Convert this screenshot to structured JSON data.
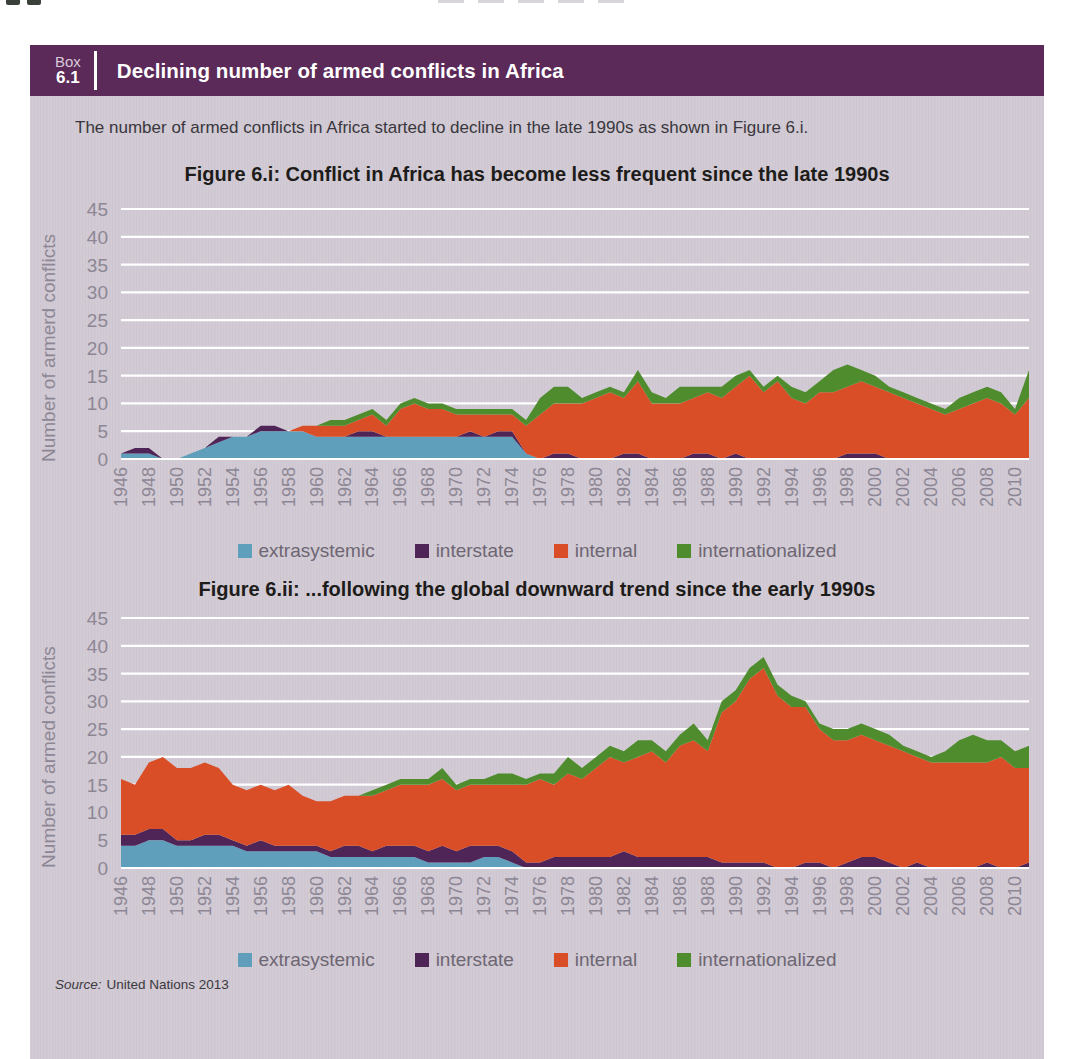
{
  "header": {
    "box_word": "Box",
    "box_number": "6.1",
    "title": "Declining number of armed conflicts in Africa"
  },
  "intro_text": "The number of armed conflicts in Africa started to decline in the late 1990s as shown in Figure 6.i.",
  "source": {
    "label": "Source:",
    "text": "United Nations 2013"
  },
  "colors": {
    "header_bar": "#5b2a58",
    "body_background": "#d1c9d3",
    "gridline": "#ffffff",
    "tick_text": "#8d8795",
    "extrasystemic": "#5f9fbb",
    "interstate": "#4f2558",
    "internal": "#d94e26",
    "internationalized": "#4e8c2e"
  },
  "legend": {
    "items": [
      {
        "label": "extrasystemic",
        "color": "#5f9fbb"
      },
      {
        "label": "interstate",
        "color": "#4f2558"
      },
      {
        "label": "internal",
        "color": "#d94e26"
      },
      {
        "label": "internationalized",
        "color": "#4e8c2e"
      }
    ]
  },
  "chart_data": [
    {
      "type": "area",
      "stacked": true,
      "title": "Figure 6.i: Conflict in Africa has become less frequent since the late 1990s",
      "ylabel": "Number of armerd conflicts",
      "xlabel": "",
      "ylim": [
        0,
        45
      ],
      "yticks": [
        0,
        5,
        10,
        15,
        20,
        25,
        30,
        35,
        40,
        45
      ],
      "grid": "horizontal-white",
      "legend_position": "below-center",
      "x_start": 1946,
      "x_end": 2011,
      "xtick_labels": [
        "1946",
        "1948",
        "1950",
        "1952",
        "1954",
        "1956",
        "1958",
        "1960",
        "1962",
        "1964",
        "1966",
        "1968",
        "1970",
        "1972",
        "1974",
        "1976",
        "1978",
        "1980",
        "1982",
        "1984",
        "1986",
        "1988",
        "1990",
        "1992",
        "1994",
        "1996",
        "1998",
        "2000",
        "2002",
        "2004",
        "2006",
        "2008",
        "2010"
      ],
      "series": [
        {
          "name": "extrasystemic",
          "color": "#5f9fbb",
          "values": [
            1,
            1,
            1,
            0,
            0,
            1,
            2,
            3,
            4,
            4,
            5,
            5,
            5,
            5,
            4,
            4,
            4,
            4,
            4,
            4,
            4,
            4,
            4,
            4,
            4,
            4,
            4,
            4,
            4,
            1,
            0,
            0,
            0,
            0,
            0,
            0,
            0,
            0,
            0,
            0,
            0,
            0,
            0,
            0,
            0,
            0,
            0,
            0,
            0,
            0,
            0,
            0,
            0,
            0,
            0,
            0,
            0,
            0,
            0,
            0,
            0,
            0,
            0,
            0,
            0,
            0
          ]
        },
        {
          "name": "interstate",
          "color": "#4f2558",
          "values": [
            0,
            1,
            1,
            0,
            0,
            0,
            0,
            1,
            0,
            0,
            1,
            1,
            0,
            0,
            0,
            0,
            0,
            1,
            1,
            0,
            0,
            0,
            0,
            0,
            0,
            1,
            0,
            1,
            1,
            0,
            0,
            1,
            1,
            0,
            0,
            0,
            1,
            1,
            0,
            0,
            0,
            1,
            1,
            0,
            1,
            0,
            0,
            0,
            0,
            0,
            0,
            0,
            1,
            1,
            1,
            0,
            0,
            0,
            0,
            0,
            0,
            0,
            0,
            0,
            0,
            0
          ]
        },
        {
          "name": "internal",
          "color": "#d94e26",
          "values": [
            0,
            0,
            0,
            0,
            0,
            0,
            0,
            0,
            0,
            0,
            0,
            0,
            0,
            1,
            2,
            2,
            2,
            2,
            3,
            2,
            5,
            6,
            5,
            5,
            4,
            3,
            4,
            3,
            3,
            5,
            8,
            9,
            9,
            10,
            11,
            12,
            10,
            13,
            10,
            10,
            10,
            10,
            11,
            11,
            12,
            15,
            12,
            14,
            11,
            10,
            12,
            12,
            12,
            13,
            12,
            12,
            11,
            10,
            9,
            8,
            9,
            10,
            11,
            10,
            8,
            11
          ]
        },
        {
          "name": "internationalized",
          "color": "#4e8c2e",
          "values": [
            0,
            0,
            0,
            0,
            0,
            0,
            0,
            0,
            0,
            0,
            0,
            0,
            0,
            0,
            0,
            1,
            1,
            1,
            1,
            1,
            1,
            1,
            1,
            1,
            1,
            1,
            1,
            1,
            1,
            1,
            3,
            3,
            3,
            1,
            1,
            1,
            1,
            2,
            2,
            1,
            3,
            2,
            1,
            2,
            2,
            1,
            1,
            1,
            2,
            2,
            2,
            4,
            4,
            2,
            2,
            1,
            1,
            1,
            1,
            1,
            2,
            2,
            2,
            2,
            1,
            5
          ]
        }
      ]
    },
    {
      "type": "area",
      "stacked": true,
      "title": "Figure 6.ii: ...following the global downward trend since the early 1990s",
      "ylabel": "Number of armed conflicts",
      "xlabel": "",
      "ylim": [
        0,
        45
      ],
      "yticks": [
        0,
        5,
        10,
        15,
        20,
        25,
        30,
        35,
        40,
        45
      ],
      "grid": "horizontal-white",
      "legend_position": "below-center",
      "x_start": 1946,
      "x_end": 2011,
      "xtick_labels": [
        "1946",
        "1948",
        "1950",
        "1952",
        "1954",
        "1956",
        "1958",
        "1960",
        "1962",
        "1964",
        "1966",
        "1968",
        "1970",
        "1972",
        "1974",
        "1976",
        "1978",
        "1980",
        "1982",
        "1984",
        "1986",
        "1988",
        "1990",
        "1992",
        "1994",
        "1996",
        "1998",
        "2000",
        "2002",
        "2004",
        "2006",
        "2008",
        "2010"
      ],
      "series": [
        {
          "name": "extrasystemic",
          "color": "#5f9fbb",
          "values": [
            4,
            4,
            5,
            5,
            4,
            4,
            4,
            4,
            4,
            3,
            3,
            3,
            3,
            3,
            3,
            2,
            2,
            2,
            2,
            2,
            2,
            2,
            1,
            1,
            1,
            1,
            2,
            2,
            1,
            0,
            0,
            0,
            0,
            0,
            0,
            0,
            0,
            0,
            0,
            0,
            0,
            0,
            0,
            0,
            0,
            0,
            0,
            0,
            0,
            0,
            0,
            0,
            0,
            0,
            0,
            0,
            0,
            0,
            0,
            0,
            0,
            0,
            0,
            0,
            0,
            0
          ]
        },
        {
          "name": "interstate",
          "color": "#4f2558",
          "values": [
            2,
            2,
            2,
            2,
            1,
            1,
            2,
            2,
            1,
            1,
            2,
            1,
            1,
            1,
            1,
            1,
            2,
            2,
            1,
            2,
            2,
            2,
            2,
            3,
            2,
            3,
            2,
            2,
            2,
            1,
            1,
            2,
            2,
            2,
            2,
            2,
            3,
            2,
            2,
            2,
            2,
            2,
            2,
            1,
            1,
            1,
            1,
            0,
            0,
            1,
            1,
            0,
            1,
            2,
            2,
            1,
            0,
            1,
            0,
            0,
            0,
            0,
            1,
            0,
            0,
            1
          ]
        },
        {
          "name": "internal",
          "color": "#d94e26",
          "values": [
            10,
            9,
            12,
            13,
            13,
            13,
            13,
            12,
            10,
            10,
            10,
            10,
            11,
            9,
            8,
            9,
            9,
            9,
            10,
            10,
            11,
            11,
            12,
            12,
            11,
            11,
            11,
            11,
            12,
            14,
            15,
            13,
            15,
            14,
            16,
            18,
            16,
            18,
            19,
            17,
            20,
            21,
            19,
            27,
            29,
            33,
            35,
            31,
            29,
            28,
            24,
            23,
            22,
            22,
            21,
            21,
            21,
            19,
            19,
            19,
            19,
            19,
            18,
            20,
            18,
            17
          ]
        },
        {
          "name": "internationalized",
          "color": "#4e8c2e",
          "values": [
            0,
            0,
            0,
            0,
            0,
            0,
            0,
            0,
            0,
            0,
            0,
            0,
            0,
            0,
            0,
            0,
            0,
            0,
            1,
            1,
            1,
            1,
            1,
            2,
            1,
            1,
            1,
            2,
            2,
            1,
            1,
            2,
            3,
            2,
            2,
            2,
            2,
            3,
            2,
            2,
            2,
            3,
            2,
            2,
            2,
            2,
            2,
            2,
            2,
            1,
            1,
            2,
            2,
            2,
            2,
            2,
            1,
            1,
            1,
            2,
            4,
            5,
            4,
            3,
            3,
            4
          ]
        }
      ]
    }
  ]
}
